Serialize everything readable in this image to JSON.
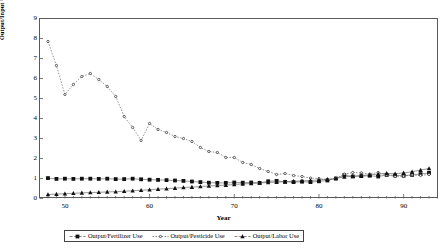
{
  "chart_data": {
    "type": "line",
    "title": "",
    "xlabel": "Year",
    "ylabel": "Output/Input Use (1982 = 100)",
    "xlim": [
      47,
      94
    ],
    "ylim": [
      0,
      9
    ],
    "xticks": [
      50,
      60,
      70,
      80,
      90
    ],
    "yticks": [
      0,
      1,
      2,
      3,
      4,
      5,
      6,
      7,
      8,
      9
    ],
    "grid": false,
    "legend_position": "below-axes",
    "minor_ticks": "every 1 year on x axis",
    "x": [
      48,
      49,
      50,
      51,
      52,
      53,
      54,
      55,
      56,
      57,
      58,
      59,
      60,
      61,
      62,
      63,
      64,
      65,
      66,
      67,
      68,
      69,
      70,
      71,
      72,
      73,
      74,
      75,
      76,
      77,
      78,
      79,
      80,
      81,
      82,
      83,
      84,
      85,
      86,
      87,
      88,
      89,
      90,
      91,
      92,
      93
    ],
    "series": [
      {
        "name": "Output/Fertilizer Use",
        "marker": "filled-square",
        "values": [
          1.02,
          0.98,
          0.99,
          0.98,
          0.99,
          0.99,
          0.98,
          0.99,
          0.97,
          0.97,
          0.99,
          0.96,
          0.94,
          0.93,
          0.92,
          0.9,
          0.88,
          0.85,
          0.82,
          0.79,
          0.78,
          0.78,
          0.8,
          0.79,
          0.8,
          0.78,
          0.86,
          0.88,
          0.83,
          0.82,
          0.84,
          0.82,
          0.86,
          0.9,
          1.0,
          1.17,
          1.1,
          1.12,
          1.14,
          1.1,
          1.18,
          1.15,
          1.14,
          1.18,
          1.22,
          1.28
        ]
      },
      {
        "name": "Output/Pesticide Use",
        "marker": "small-circle",
        "values": [
          7.85,
          6.65,
          5.2,
          5.7,
          6.1,
          6.25,
          5.95,
          5.6,
          5.1,
          4.1,
          3.55,
          2.9,
          3.75,
          3.45,
          3.3,
          3.1,
          3.0,
          2.85,
          2.55,
          2.35,
          2.3,
          2.05,
          2.05,
          1.8,
          1.7,
          1.5,
          1.35,
          1.2,
          1.25,
          1.15,
          1.1,
          1.02,
          1.0,
          0.95,
          1.0,
          1.22,
          1.3,
          1.28,
          1.22,
          1.3,
          1.18,
          1.1,
          1.12,
          1.18,
          1.15,
          1.2
        ]
      },
      {
        "name": "Output/Labor Use",
        "marker": "filled-triangle",
        "values": [
          0.2,
          0.22,
          0.24,
          0.26,
          0.28,
          0.3,
          0.31,
          0.33,
          0.34,
          0.36,
          0.39,
          0.41,
          0.44,
          0.47,
          0.49,
          0.52,
          0.55,
          0.57,
          0.6,
          0.63,
          0.65,
          0.67,
          0.7,
          0.73,
          0.75,
          0.78,
          0.8,
          0.82,
          0.84,
          0.86,
          0.88,
          0.9,
          0.93,
          0.96,
          1.0,
          1.08,
          1.12,
          1.15,
          1.18,
          1.22,
          1.26,
          1.24,
          1.28,
          1.34,
          1.42,
          1.5
        ]
      }
    ]
  },
  "axes": {
    "y_title": "Output/Input Use (1982 = 100)",
    "x_title": "Year",
    "y_tick_labels": [
      "0",
      "1",
      "2",
      "3",
      "4",
      "5",
      "6",
      "7",
      "8",
      "9"
    ],
    "x_tick_labels": [
      "50",
      "60",
      "70",
      "80",
      "90"
    ]
  },
  "legend": {
    "entries": [
      {
        "label": "Output/Fertilizer Use",
        "marker": "filled-square"
      },
      {
        "label": "Output/Pesticide Use",
        "marker": "small-circle"
      },
      {
        "label": "Output/Labor Use",
        "marker": "filled-triangle"
      }
    ]
  },
  "colors": {
    "line": "#555555",
    "marker": "#111111",
    "frame": "#5a5a5a"
  }
}
